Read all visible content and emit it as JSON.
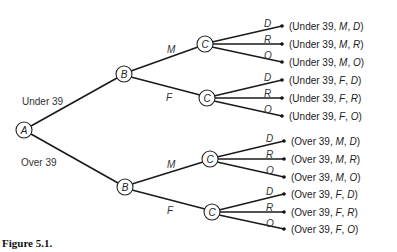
{
  "figure": {
    "caption": "Figure 5.1.",
    "type": "tree-diagram"
  },
  "nodes": {
    "root": {
      "label": "A",
      "x": 24,
      "y": 130
    },
    "b_under": {
      "label": "B",
      "x": 124,
      "y": 74
    },
    "b_over": {
      "label": "B",
      "x": 125,
      "y": 187
    },
    "c_under_m": {
      "label": "C",
      "x": 205,
      "y": 44
    },
    "c_under_f": {
      "label": "C",
      "x": 207,
      "y": 98
    },
    "c_over_m": {
      "label": "C",
      "x": 210,
      "y": 159
    },
    "c_over_f": {
      "label": "C",
      "x": 212,
      "y": 212
    }
  },
  "edge_labels": {
    "age_under": "Under 39",
    "age_over": "Over 39",
    "gender_m": "M",
    "gender_f": "F",
    "party_d": "D",
    "party_r": "R",
    "party_o": "O"
  },
  "outcomes": [
    {
      "age": "Under 39",
      "gender": "M",
      "party": "D"
    },
    {
      "age": "Under 39",
      "gender": "M",
      "party": "R"
    },
    {
      "age": "Under 39",
      "gender": "M",
      "party": "O"
    },
    {
      "age": "Under 39",
      "gender": "F",
      "party": "D"
    },
    {
      "age": "Under 39",
      "gender": "F",
      "party": "R"
    },
    {
      "age": "Under 39",
      "gender": "F",
      "party": "O"
    },
    {
      "age": "Over 39",
      "gender": "M",
      "party": "D"
    },
    {
      "age": "Over 39",
      "gender": "M",
      "party": "R"
    },
    {
      "age": "Over 39",
      "gender": "M",
      "party": "O"
    },
    {
      "age": "Over 39",
      "gender": "F",
      "party": "D"
    },
    {
      "age": "Over 39",
      "gender": "F",
      "party": "R"
    },
    {
      "age": "Over 39",
      "gender": "F",
      "party": "O"
    }
  ],
  "punct": {
    "open": "(",
    "sep": ", ",
    "close": ")"
  }
}
